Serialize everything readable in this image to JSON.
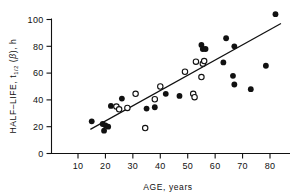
{
  "chart_data": {
    "type": "scatter",
    "title": "",
    "xlabel": "AGE, years",
    "ylabel": "HALF-LIFE, t1/2 (β), h",
    "ylabel_parts": {
      "prefix": "HALF–LIFE, t",
      "subscript": "1/2",
      "middle": " (",
      "greek": "β",
      "suffix": "), h"
    },
    "xlim": [
      0,
      88
    ],
    "ylim": [
      0,
      104
    ],
    "xticks": [
      10,
      20,
      30,
      40,
      50,
      60,
      70,
      80
    ],
    "yticks": [
      0,
      20,
      40,
      60,
      80,
      100
    ],
    "xtick_labels": [
      "10",
      "20",
      "30",
      "40",
      "50",
      "60",
      "70",
      "80"
    ],
    "ytick_labels": [
      "0",
      "20",
      "40",
      "60",
      "80",
      "100"
    ],
    "grid": false,
    "legend": "none",
    "series": [
      {
        "name": "filled",
        "marker": "filled-circle",
        "color": "#111111",
        "points": [
          [
            15,
            24
          ],
          [
            19,
            22
          ],
          [
            19.5,
            17
          ],
          [
            20,
            21
          ],
          [
            21,
            20
          ],
          [
            22,
            35.5
          ],
          [
            26,
            41
          ],
          [
            35,
            33.5
          ],
          [
            38,
            34.5
          ],
          [
            42,
            44.5
          ],
          [
            47,
            43
          ],
          [
            55,
            81
          ],
          [
            55.5,
            78
          ],
          [
            56.5,
            78
          ],
          [
            63,
            68
          ],
          [
            64,
            86
          ],
          [
            67,
            80
          ],
          [
            67,
            51.5
          ],
          [
            66.5,
            58
          ],
          [
            73,
            48
          ],
          [
            78.5,
            65.5
          ],
          [
            82,
            104
          ]
        ]
      },
      {
        "name": "open",
        "marker": "open-circle",
        "color": "#111111",
        "points": [
          [
            24,
            35
          ],
          [
            25,
            33
          ],
          [
            28,
            34
          ],
          [
            31,
            44.5
          ],
          [
            34.5,
            19
          ],
          [
            38,
            40.5
          ],
          [
            40,
            50
          ],
          [
            49,
            61
          ],
          [
            52,
            44.5
          ],
          [
            52.5,
            42
          ],
          [
            53,
            68.5
          ],
          [
            55,
            57
          ],
          [
            55.5,
            67
          ],
          [
            56,
            69
          ]
        ]
      }
    ],
    "fit_line": {
      "name": "regression-line",
      "x_start": 14.5,
      "y_start": 18,
      "x_end": 84,
      "y_end": 97
    }
  }
}
